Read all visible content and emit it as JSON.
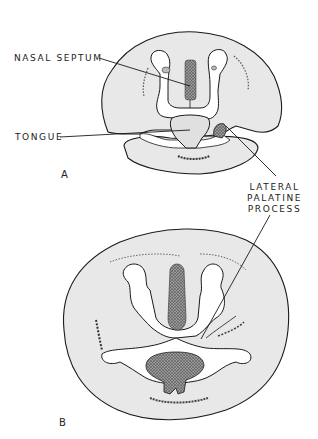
{
  "figure": {
    "panels": [
      {
        "id": "A",
        "label": "A"
      },
      {
        "id": "B",
        "label": "B"
      }
    ],
    "labels": {
      "nasal_septum": "NASAL SEPTUM",
      "tongue": "TONGUE",
      "lateral_palatine_process": [
        "LATERAL",
        "PALATINE",
        "PROCESS"
      ]
    },
    "colors": {
      "tissue_fill": "#e6e6e6",
      "outline": "#1a1a1a",
      "stipple": "#555555",
      "background": "#ffffff"
    }
  }
}
